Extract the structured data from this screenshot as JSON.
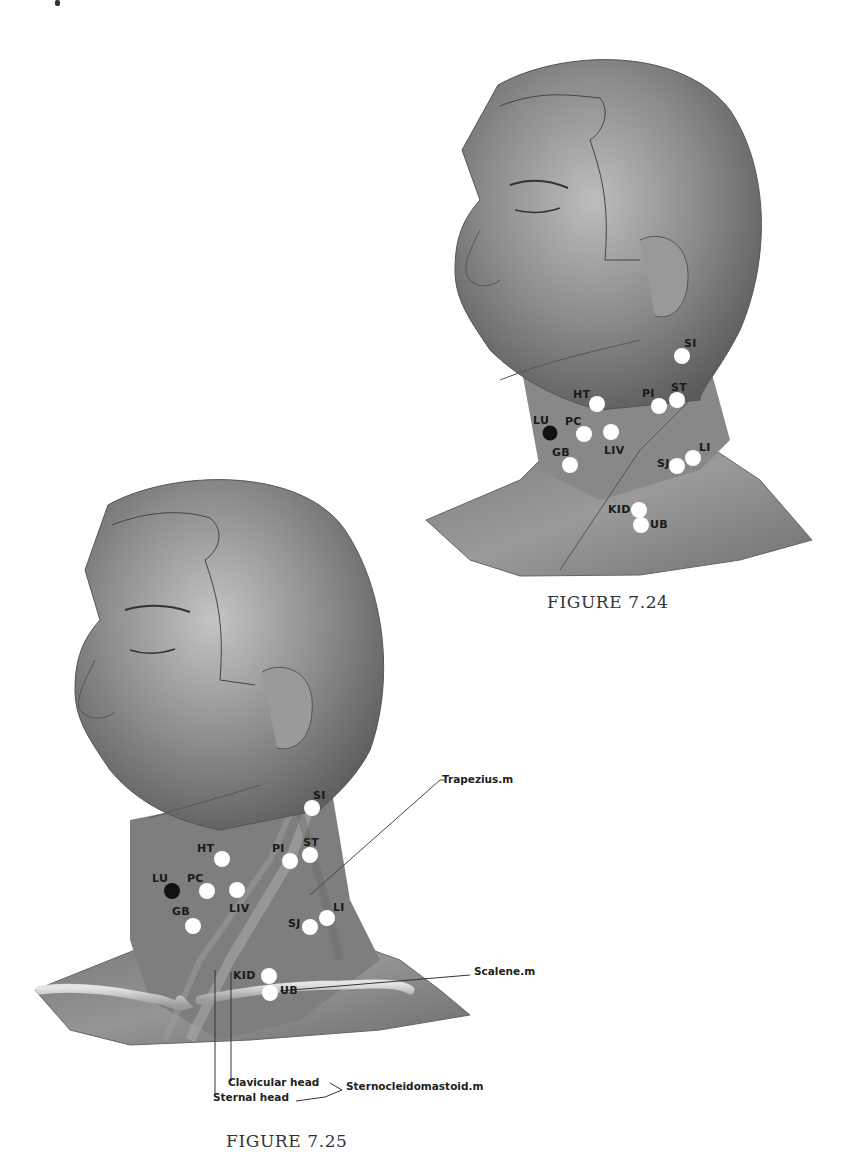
{
  "figure_7_24": {
    "caption": "FIGURE 7.24",
    "points": [
      {
        "label": "SI",
        "fill": "#ffffff"
      },
      {
        "label": "HT",
        "fill": "#ffffff"
      },
      {
        "label": "PI",
        "fill": "#ffffff"
      },
      {
        "label": "ST",
        "fill": "#ffffff"
      },
      {
        "label": "LU",
        "fill": "#111111"
      },
      {
        "label": "PC",
        "fill": "#ffffff"
      },
      {
        "label": "LIV",
        "fill": "#ffffff"
      },
      {
        "label": "GB",
        "fill": "#ffffff"
      },
      {
        "label": "SJ",
        "fill": "#ffffff"
      },
      {
        "label": "LI",
        "fill": "#ffffff"
      },
      {
        "label": "KID",
        "fill": "#ffffff"
      },
      {
        "label": "UB",
        "fill": "#ffffff"
      }
    ]
  },
  "figure_7_25": {
    "caption": "FIGURE 7.25",
    "points": [
      {
        "label": "SI",
        "fill": "#ffffff"
      },
      {
        "label": "HT",
        "fill": "#ffffff"
      },
      {
        "label": "PI",
        "fill": "#ffffff"
      },
      {
        "label": "ST",
        "fill": "#ffffff"
      },
      {
        "label": "LU",
        "fill": "#111111"
      },
      {
        "label": "PC",
        "fill": "#ffffff"
      },
      {
        "label": "LIV",
        "fill": "#ffffff"
      },
      {
        "label": "GB",
        "fill": "#ffffff"
      },
      {
        "label": "SJ",
        "fill": "#ffffff"
      },
      {
        "label": "LI",
        "fill": "#ffffff"
      },
      {
        "label": "KID",
        "fill": "#ffffff"
      },
      {
        "label": "UB",
        "fill": "#ffffff"
      }
    ],
    "callouts": {
      "trapezius": "Trapezius.m",
      "scalene": "Scalene.m",
      "clavicular_head": "Clavicular head",
      "sternal_head": "Sternal head",
      "sternocleidomastoid": "Sternocleidomastoid.m"
    }
  },
  "colors": {
    "skin_dark": "#6e6e6e",
    "skin_mid": "#8c8c8c",
    "skin_light": "#c8c8c8",
    "point_white": "#ffffff",
    "point_black": "#111111",
    "text": "#1a1a1a"
  }
}
